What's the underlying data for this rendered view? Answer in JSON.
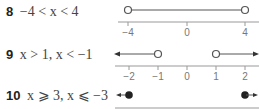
{
  "questions": [
    {
      "number": "8",
      "expression": "−4 < x < 4",
      "ticks": [
        "−4",
        "0",
        "4"
      ]
    },
    {
      "number": "9",
      "expression": "x > 1, x < −1",
      "ticks": [
        "−2",
        "−1",
        "0",
        "1",
        "2"
      ]
    },
    {
      "number": "10",
      "expression": "x ⩾ 3, x ⩽ −3",
      "ticks": []
    }
  ],
  "colors": {
    "line": "#555555",
    "axis": "#999999",
    "text": "#444444"
  }
}
